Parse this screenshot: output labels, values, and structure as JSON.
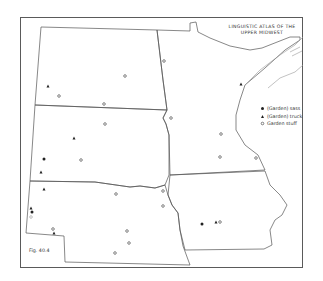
{
  "map": {
    "title_line1": "LINGUISTIC ATLAS OF THE",
    "title_line2": "UPPER MIDWEST",
    "figure_label": "Fig. 40.4",
    "colors": {
      "border": "#555555",
      "lake": "#9a9a9a",
      "symbol": "#222222"
    }
  },
  "legend": {
    "items": [
      {
        "symbol": "filled-circle",
        "label": "(Garden) sass"
      },
      {
        "symbol": "filled-triangle",
        "label": "(Garden) truck"
      },
      {
        "symbol": "open-circle",
        "label": "Garden stuff"
      }
    ]
  },
  "markers": {
    "garden_sass": [
      [
        44,
        159
      ],
      [
        32,
        212
      ],
      [
        202,
        224
      ]
    ],
    "garden_truck": [
      [
        48,
        86
      ],
      [
        74,
        138
      ],
      [
        41,
        172
      ],
      [
        44,
        189
      ],
      [
        31,
        208
      ],
      [
        54,
        233
      ],
      [
        216,
        222
      ],
      [
        241,
        84
      ]
    ],
    "garden_stuff": [
      [
        164,
        61
      ],
      [
        125,
        76
      ],
      [
        59,
        96
      ],
      [
        104,
        104
      ],
      [
        171,
        118
      ],
      [
        105,
        124
      ],
      [
        221,
        134
      ],
      [
        81,
        160
      ],
      [
        220,
        157
      ],
      [
        256,
        158
      ],
      [
        163,
        191
      ],
      [
        116,
        194
      ],
      [
        163,
        206
      ],
      [
        53,
        229
      ],
      [
        127,
        231
      ],
      [
        129,
        243
      ],
      [
        115,
        253
      ],
      [
        220,
        222
      ],
      [
        31,
        217
      ]
    ]
  }
}
